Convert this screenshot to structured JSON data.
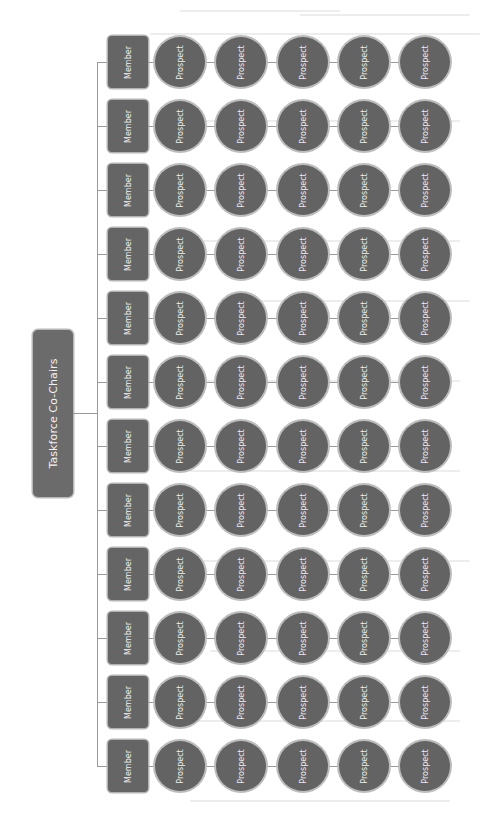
{
  "diagram": {
    "type": "org-chart",
    "orientation": "rotated-90",
    "root": {
      "label": "Taskforce Co-Chairs"
    },
    "member_label": "Member",
    "prospect_label": "Prospect",
    "rows": [
      {
        "member": "Member",
        "prospects": [
          "Prospect",
          "Prospect",
          "Prospect",
          "Prospect",
          "Prospect"
        ]
      },
      {
        "member": "Member",
        "prospects": [
          "Prospect",
          "Prospect",
          "Prospect",
          "Prospect",
          "Prospect"
        ]
      },
      {
        "member": "Member",
        "prospects": [
          "Prospect",
          "Prospect",
          "Prospect",
          "Prospect",
          "Prospect"
        ]
      },
      {
        "member": "Member",
        "prospects": [
          "Prospect",
          "Prospect",
          "Prospect",
          "Prospect",
          "Prospect"
        ]
      },
      {
        "member": "Member",
        "prospects": [
          "Prospect",
          "Prospect",
          "Prospect",
          "Prospect",
          "Prospect"
        ]
      },
      {
        "member": "Member",
        "prospects": [
          "Prospect",
          "Prospect",
          "Prospect",
          "Prospect",
          "Prospect"
        ]
      },
      {
        "member": "Member",
        "prospects": [
          "Prospect",
          "Prospect",
          "Prospect",
          "Prospect",
          "Prospect"
        ]
      },
      {
        "member": "Member",
        "prospects": [
          "Prospect",
          "Prospect",
          "Prospect",
          "Prospect",
          "Prospect"
        ]
      },
      {
        "member": "Member",
        "prospects": [
          "Prospect",
          "Prospect",
          "Prospect",
          "Prospect",
          "Prospect"
        ]
      },
      {
        "member": "Member",
        "prospects": [
          "Prospect",
          "Prospect",
          "Prospect",
          "Prospect",
          "Prospect"
        ]
      },
      {
        "member": "Member",
        "prospects": [
          "Prospect",
          "Prospect",
          "Prospect",
          "Prospect",
          "Prospect"
        ]
      },
      {
        "member": "Member",
        "prospects": [
          "Prospect",
          "Prospect",
          "Prospect",
          "Prospect",
          "Prospect"
        ]
      }
    ],
    "colors": {
      "node_fill": "#656565",
      "node_border": "#b4b4b4",
      "node_text": "#eeeeee",
      "connector": "#9a9a9a",
      "background": "#ffffff"
    }
  }
}
